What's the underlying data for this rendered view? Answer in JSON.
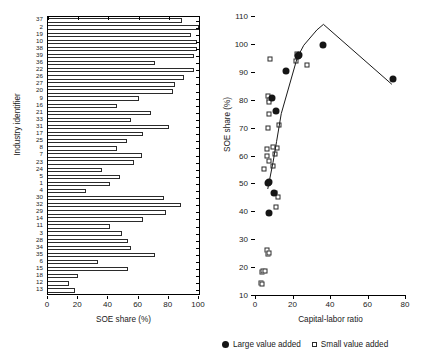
{
  "figure": {
    "legend": [
      {
        "label": "Large value added",
        "marker": "filled-circle"
      },
      {
        "label": "Small value added",
        "marker": "open-square"
      }
    ]
  },
  "chart_data": [
    {
      "type": "bar",
      "orientation": "horizontal",
      "title": "",
      "xlabel": "SOE share (%)",
      "ylabel": "Industry identifier",
      "xlim": [
        0,
        100
      ],
      "xticks": [
        0,
        20,
        40,
        60,
        80,
        100
      ],
      "grid": false,
      "categories": [
        "37",
        "2",
        "19",
        "10",
        "38",
        "39",
        "36",
        "22",
        "26",
        "27",
        "20",
        "9",
        "16",
        "21",
        "33",
        "31",
        "17",
        "25",
        "8",
        "7",
        "23",
        "24",
        "5",
        "1",
        "4",
        "30",
        "32",
        "29",
        "14",
        "11",
        "3",
        "28",
        "34",
        "35",
        "6",
        "15",
        "18",
        "12",
        "13"
      ],
      "values": [
        89,
        100,
        95,
        99,
        99,
        97,
        71,
        97,
        90,
        84,
        83,
        60,
        46,
        68,
        55,
        80,
        63,
        52,
        46,
        62,
        57,
        36,
        48,
        41,
        25,
        77,
        88,
        78,
        63,
        41,
        49,
        53,
        55,
        71,
        33,
        53,
        20,
        14,
        18
      ]
    },
    {
      "type": "scatter",
      "title": "",
      "xlabel": "Capital-labor ratio",
      "ylabel": "SOE share (%)",
      "xlim": [
        0,
        80
      ],
      "ylim": [
        10,
        110
      ],
      "xticks": [
        0,
        20,
        40,
        60,
        80
      ],
      "yticks": [
        10,
        20,
        30,
        40,
        50,
        60,
        70,
        80,
        90,
        100,
        110
      ],
      "grid": false,
      "legend_position": "below",
      "series": [
        {
          "name": "Large value added",
          "marker": "filled-circle",
          "points": [
            [
              7.0,
              50.2
            ],
            [
              7.3,
              50.5
            ],
            [
              7.6,
              39.4
            ],
            [
              10.2,
              46.5
            ],
            [
              9.0,
              80.5
            ],
            [
              11.0,
              76.0
            ],
            [
              16.5,
              90.2
            ],
            [
              23.5,
              96.0
            ],
            [
              23.0,
              95.5
            ],
            [
              36.0,
              99.5
            ],
            [
              73.5,
              87.5
            ]
          ]
        },
        {
          "name": "Small value added",
          "marker": "open-square",
          "points": [
            [
              3.3,
              14.2
            ],
            [
              3.7,
              14.0
            ],
            [
              3.5,
              18.2
            ],
            [
              4.4,
              18.6
            ],
            [
              5.2,
              18.5
            ],
            [
              6.2,
              26.3
            ],
            [
              6.9,
              24.8
            ],
            [
              7.6,
              24.9
            ],
            [
              5.0,
              55.0
            ],
            [
              6.2,
              62.5
            ],
            [
              6.6,
              59.7
            ],
            [
              7.2,
              58.0
            ],
            [
              7.0,
              69.8
            ],
            [
              7.2,
              75.0
            ],
            [
              7.0,
              81.5
            ],
            [
              7.4,
              80.0
            ],
            [
              7.2,
              79.0
            ],
            [
              8.2,
              94.5
            ],
            [
              9.4,
              63.0
            ],
            [
              9.7,
              56.3
            ],
            [
              10.5,
              46.5
            ],
            [
              11.2,
              41.7
            ],
            [
              12.2,
              45.2
            ],
            [
              10.5,
              60.5
            ],
            [
              11.5,
              62.8
            ],
            [
              13.0,
              71.0
            ],
            [
              22.5,
              96.3
            ],
            [
              22.0,
              94.0
            ],
            [
              27.5,
              92.3
            ]
          ]
        }
      ],
      "trend_line": {
        "name": "fitted-trend",
        "points": [
          [
            6.8,
            48.0
          ],
          [
            9.6,
            57.5
          ],
          [
            11.5,
            65.0
          ],
          [
            14.0,
            75.0
          ],
          [
            22.5,
            95.0
          ],
          [
            26.0,
            99.5
          ],
          [
            33.0,
            105.0
          ],
          [
            36.5,
            107.0
          ],
          [
            73.0,
            85.5
          ]
        ]
      }
    }
  ]
}
